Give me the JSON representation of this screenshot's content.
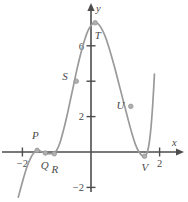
{
  "figure": {
    "title": "",
    "axis_labels": {
      "x": "x",
      "y": "y"
    },
    "x_ticks": [
      {
        "label": "-2",
        "value": -2
      },
      {
        "label": "2",
        "value": 2
      }
    ],
    "y_ticks": [
      {
        "label": "2",
        "value": 2
      },
      {
        "label": "",
        "value": 4
      },
      {
        "label": "6",
        "value": 6
      },
      {
        "label": "-2",
        "value": -2
      }
    ]
  },
  "chart_data": {
    "type": "line",
    "title": "",
    "xlabel": "x",
    "ylabel": "y",
    "xlim": [
      -2.15,
      2.05
    ],
    "ylim": [
      -2.6,
      7.6
    ],
    "grid": false,
    "legend": "none",
    "series": [
      {
        "name": "curve",
        "color": "#9a9a9a",
        "x": [
          -2.12,
          -2.05,
          -1.95,
          -1.85,
          -1.75,
          -1.68,
          -1.6,
          -1.52,
          -1.45,
          -1.38,
          -1.3,
          -1.2,
          -1.1,
          -1.0,
          -0.9,
          -0.8,
          -0.7,
          -0.6,
          -0.5,
          -0.4,
          -0.3,
          -0.2,
          -0.1,
          0.0,
          0.1,
          0.2,
          0.3,
          0.4,
          0.5,
          0.6,
          0.7,
          0.8,
          0.9,
          1.0,
          1.1,
          1.2,
          1.3,
          1.4,
          1.5,
          1.55,
          1.6,
          1.65,
          1.7,
          1.75,
          1.8,
          1.85
        ],
        "y": [
          -2.55,
          -2.05,
          -1.35,
          -0.75,
          -0.3,
          -0.08,
          0.05,
          0.08,
          0.03,
          -0.04,
          -0.08,
          -0.1,
          -0.05,
          0.1,
          0.55,
          1.25,
          2.05,
          2.95,
          3.85,
          4.75,
          5.55,
          6.25,
          6.8,
          7.15,
          7.3,
          7.25,
          7.0,
          6.6,
          6.05,
          5.4,
          4.7,
          3.95,
          3.2,
          2.45,
          1.7,
          1.0,
          0.4,
          0.0,
          -0.22,
          -0.25,
          -0.18,
          0.05,
          0.55,
          1.4,
          2.7,
          4.4
        ]
      }
    ],
    "annotations": [
      {
        "name": "P",
        "label": "P",
        "x": -1.57,
        "y": 0.09,
        "label_dx": -0.05,
        "label_dy": 0.82
      },
      {
        "name": "Q",
        "label": "Q",
        "x": -1.33,
        "y": -0.06,
        "label_dx": -0.02,
        "label_dy": -0.72
      },
      {
        "name": "R",
        "label": "R",
        "x": -1.07,
        "y": -0.1,
        "label_dx": 0.02,
        "label_dy": -0.9
      },
      {
        "name": "S",
        "label": "S",
        "x": -0.43,
        "y": 4.0,
        "label_dx": -0.33,
        "label_dy": 0.28
      },
      {
        "name": "T",
        "label": "T",
        "x": 0.12,
        "y": 7.3,
        "label_dx": 0.08,
        "label_dy": -0.72
      },
      {
        "name": "U",
        "label": "U",
        "x": 1.16,
        "y": 2.58,
        "label_dx": -0.3,
        "label_dy": 0.08
      },
      {
        "name": "V",
        "label": "V",
        "x": 1.56,
        "y": -0.24,
        "label_dx": 0.01,
        "label_dy": -0.62
      }
    ]
  }
}
